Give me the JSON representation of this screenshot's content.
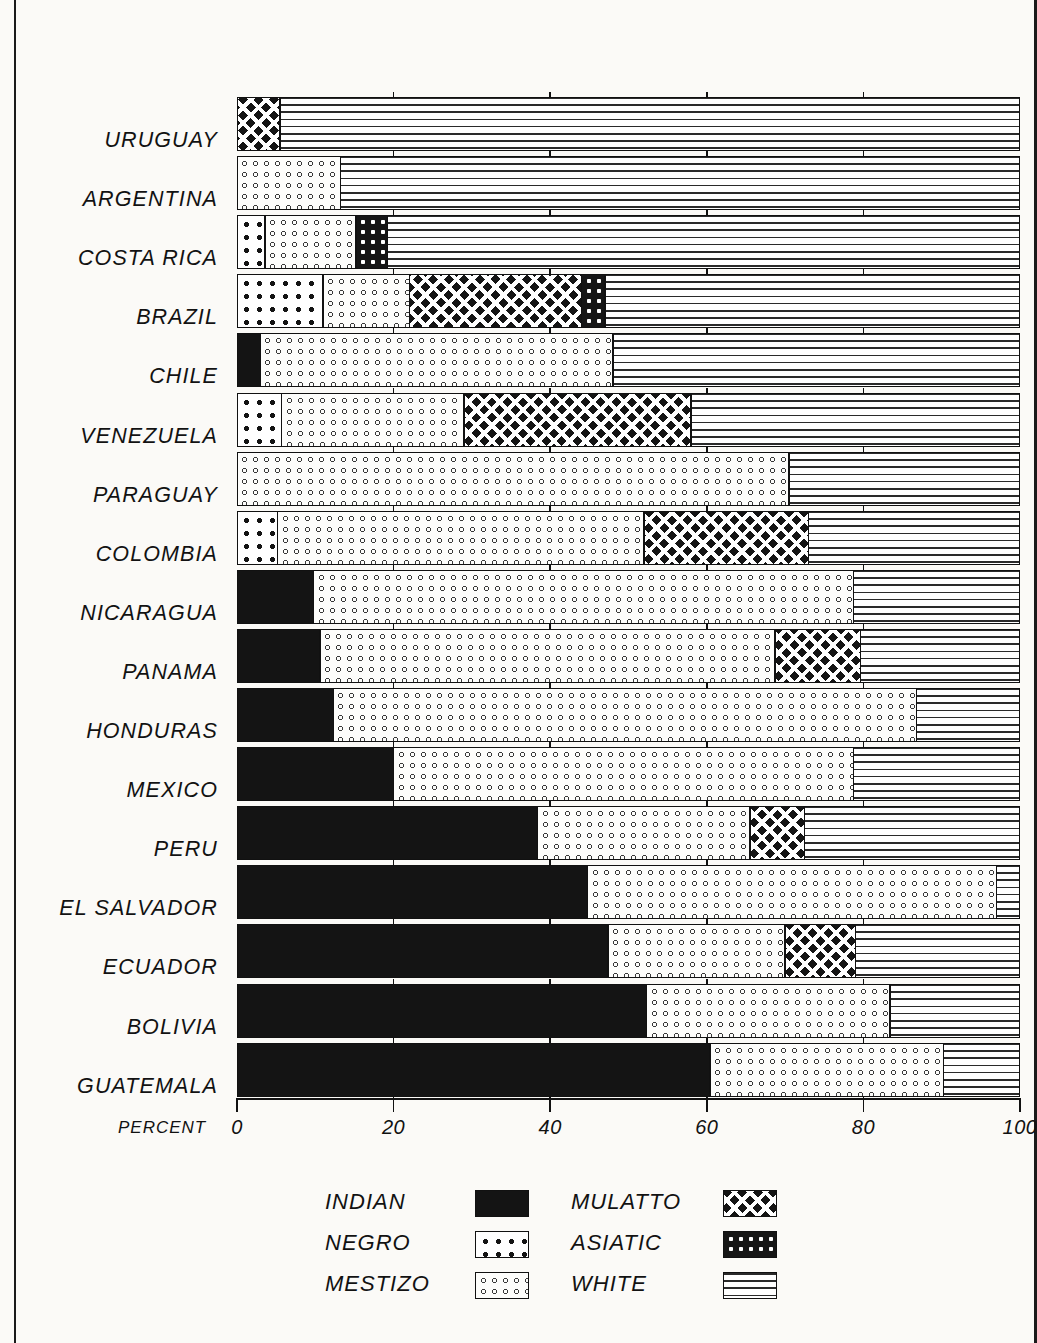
{
  "chart_data": {
    "type": "bar",
    "subtype": "horizontal-stacked-100",
    "title": "",
    "xlabel": "PERCENT",
    "ylabel": "",
    "xlim": [
      0,
      100
    ],
    "xticks": [
      0,
      20,
      40,
      60,
      80,
      100
    ],
    "xtick_labels": [
      "0",
      "20",
      "40",
      "60",
      "80",
      "100"
    ],
    "grid": false,
    "legend_position": "bottom",
    "series": [
      {
        "name": "INDIAN",
        "pattern": "solid-black"
      },
      {
        "name": "NEGRO",
        "pattern": "white-with-black-squares"
      },
      {
        "name": "MESTIZO",
        "pattern": "white-with-open-circles"
      },
      {
        "name": "MULATTO",
        "pattern": "black-diamond-lattice"
      },
      {
        "name": "ASIATIC",
        "pattern": "black-with-white-dots"
      },
      {
        "name": "WHITE",
        "pattern": "horizontal-lines"
      }
    ],
    "categories": [
      "URUGUAY",
      "ARGENTINA",
      "COSTA RICA",
      "BRAZIL",
      "CHILE",
      "VENEZUELA",
      "PARAGUAY",
      "COLOMBIA",
      "NICARAGUA",
      "PANAMA",
      "HONDURAS",
      "MEXICO",
      "PERU",
      "EL SALVADOR",
      "ECUADOR",
      "BOLIVIA",
      "GUATEMALA"
    ],
    "rows": [
      {
        "country": "URUGUAY",
        "INDIAN": 0,
        "NEGRO": 0,
        "MESTIZO": 0,
        "MULATTO": 5.5,
        "ASIATIC": 0,
        "WHITE": 94.5
      },
      {
        "country": "ARGENTINA",
        "INDIAN": 0,
        "NEGRO": 0,
        "MESTIZO": 13.2,
        "MULATTO": 0,
        "ASIATIC": 0,
        "WHITE": 86.8
      },
      {
        "country": "COSTA RICA",
        "INDIAN": 0,
        "NEGRO": 3.6,
        "MESTIZO": 11.6,
        "MULATTO": 0,
        "ASIATIC": 4.0,
        "WHITE": 80.8
      },
      {
        "country": "BRAZIL",
        "INDIAN": 0,
        "NEGRO": 11.0,
        "MESTIZO": 11.0,
        "MULATTO": 22.0,
        "ASIATIC": 3.0,
        "WHITE": 53.0
      },
      {
        "country": "CHILE",
        "INDIAN": 3.0,
        "NEGRO": 0,
        "MESTIZO": 45.0,
        "MULATTO": 0,
        "ASIATIC": 0,
        "WHITE": 52.0
      },
      {
        "country": "VENEZUELA",
        "INDIAN": 0,
        "NEGRO": 5.7,
        "MESTIZO": 23.3,
        "MULATTO": 29.0,
        "ASIATIC": 0,
        "WHITE": 42.0
      },
      {
        "country": "PARAGUAY",
        "INDIAN": 0,
        "NEGRO": 0,
        "MESTIZO": 70.5,
        "MULATTO": 0,
        "ASIATIC": 0,
        "WHITE": 29.5
      },
      {
        "country": "COLOMBIA",
        "INDIAN": 0,
        "NEGRO": 5.2,
        "MESTIZO": 46.8,
        "MULATTO": 21.0,
        "ASIATIC": 0,
        "WHITE": 27.0
      },
      {
        "country": "NICARAGUA",
        "INDIAN": 9.8,
        "NEGRO": 0,
        "MESTIZO": 68.9,
        "MULATTO": 0,
        "ASIATIC": 0,
        "WHITE": 21.3
      },
      {
        "country": "PANAMA",
        "INDIAN": 10.6,
        "NEGRO": 0,
        "MESTIZO": 58.1,
        "MULATTO": 10.9,
        "ASIATIC": 0,
        "WHITE": 20.4
      },
      {
        "country": "HONDURAS",
        "INDIAN": 12.3,
        "NEGRO": 0,
        "MESTIZO": 74.5,
        "MULATTO": 0,
        "ASIATIC": 0,
        "WHITE": 13.2
      },
      {
        "country": "MEXICO",
        "INDIAN": 20.0,
        "NEGRO": 0,
        "MESTIZO": 58.7,
        "MULATTO": 0,
        "ASIATIC": 0,
        "WHITE": 21.3
      },
      {
        "country": "PERU",
        "INDIAN": 38.4,
        "NEGRO": 0,
        "MESTIZO": 27.1,
        "MULATTO": 7.0,
        "ASIATIC": 0,
        "WHITE": 27.5
      },
      {
        "country": "EL SALVADOR",
        "INDIAN": 44.8,
        "NEGRO": 0,
        "MESTIZO": 52.2,
        "MULATTO": 0,
        "ASIATIC": 0,
        "WHITE": 3.0
      },
      {
        "country": "ECUADOR",
        "INDIAN": 47.4,
        "NEGRO": 0,
        "MESTIZO": 22.6,
        "MULATTO": 9.0,
        "ASIATIC": 0,
        "WHITE": 21.0
      },
      {
        "country": "BOLIVIA",
        "INDIAN": 52.3,
        "NEGRO": 0,
        "MESTIZO": 31.1,
        "MULATTO": 0,
        "ASIATIC": 0,
        "WHITE": 16.6
      },
      {
        "country": "GUATEMALA",
        "INDIAN": 60.4,
        "NEGRO": 0,
        "MESTIZO": 29.8,
        "MULATTO": 0,
        "ASIATIC": 0,
        "WHITE": 9.8
      }
    ]
  },
  "axis": {
    "percent_caption": "PERCENT",
    "ticks": [
      "0",
      "20",
      "40",
      "60",
      "80",
      "100"
    ]
  },
  "legend": {
    "columns": [
      {
        "items": [
          {
            "label": "INDIAN",
            "swatch": "indian"
          },
          {
            "label": "NEGRO",
            "swatch": "negro"
          },
          {
            "label": "MESTIZO",
            "swatch": "mestizo"
          }
        ]
      },
      {
        "items": [
          {
            "label": "MULATTO",
            "swatch": "mulatto"
          },
          {
            "label": "ASIATIC",
            "swatch": "asiatic"
          },
          {
            "label": "WHITE",
            "swatch": "white"
          }
        ]
      }
    ]
  },
  "colors": {
    "ink": "#141414",
    "paper": "#fbfaf7"
  }
}
